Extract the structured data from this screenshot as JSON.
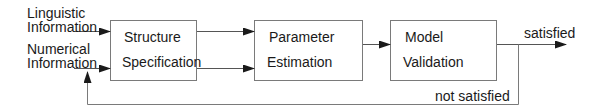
{
  "inputs": {
    "linguistic": [
      "Linguistic",
      "Information"
    ],
    "numerical": [
      "Numerical",
      "Information"
    ]
  },
  "blocks": [
    {
      "line1": "Structure",
      "line2": "Specification"
    },
    {
      "line1": "Parameter",
      "line2": "Estimation"
    },
    {
      "line1": "Model",
      "line2": "Validation"
    }
  ],
  "outputs": {
    "satisfied": "satisfied",
    "not_satisfied": "not satisfied"
  },
  "colors": {
    "stroke": "#7a7a7a",
    "arrow": "#1a1a1a",
    "text": "#1a1a1a"
  }
}
